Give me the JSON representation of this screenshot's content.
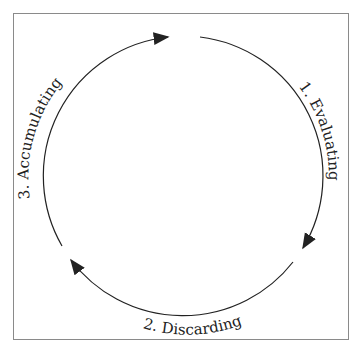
{
  "diagram": {
    "type": "cycle",
    "steps": [
      {
        "label": "1. Evaluating"
      },
      {
        "label": "2. Discarding"
      },
      {
        "label": "3. Accumulating"
      }
    ],
    "stroke_color": "#222222",
    "frame_color": "#8a8a8a"
  }
}
